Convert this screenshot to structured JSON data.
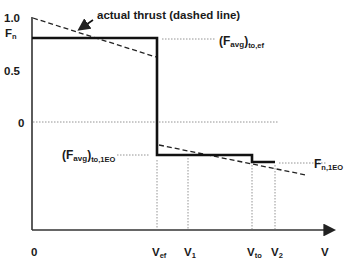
{
  "diagram": {
    "annotation": "actual thrust (dashed line)",
    "y_axis": {
      "label_main": "F",
      "label_sub": "n",
      "ticks": [
        "1.0",
        "0.5",
        "0"
      ]
    },
    "x_axis": {
      "origin": "0",
      "axis_label": "V",
      "points": [
        {
          "main": "V",
          "sub": "ef"
        },
        {
          "main": "V",
          "sub": "1"
        },
        {
          "main": "V",
          "sub": "to"
        },
        {
          "main": "V",
          "sub": "2"
        }
      ]
    },
    "labels": {
      "favg_to_ef": {
        "main": "(F",
        "sub1": "avg",
        "close": ")",
        "sub2": "to,ef"
      },
      "favg_to_1eo": {
        "main": "(F",
        "sub1": "avg",
        "close": ")",
        "sub2": "to,1EO"
      },
      "fn_1eo": {
        "main": "F",
        "sub": "n,1EO"
      }
    }
  }
}
